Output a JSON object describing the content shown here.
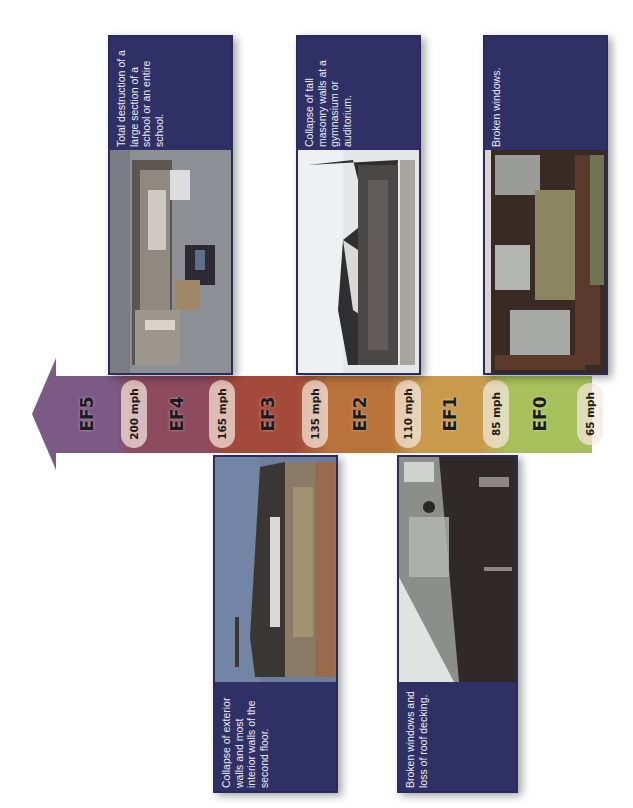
{
  "scale": {
    "title": "Enhanced Fujita Scale",
    "orientation": "rotated -90deg; arrow points left toward stronger ratings",
    "levels": [
      {
        "id": "EF5",
        "label": "EF5",
        "color": "#7b5a86"
      },
      {
        "id": "EF4",
        "label": "EF4",
        "color": "#8e4a5e"
      },
      {
        "id": "EF3",
        "label": "EF3",
        "color": "#a44a3b"
      },
      {
        "id": "EF2",
        "label": "EF2",
        "color": "#b9733a"
      },
      {
        "id": "EF1",
        "label": "EF1",
        "color": "#c99a4c"
      },
      {
        "id": "EF0",
        "label": "EF0",
        "color": "#a7c05a"
      }
    ],
    "thresholds": [
      {
        "label": "200 mph"
      },
      {
        "label": "165 mph"
      },
      {
        "label": "135 mph"
      },
      {
        "label": "110 mph"
      },
      {
        "label": "85 mph"
      },
      {
        "label": "65 mph"
      }
    ]
  },
  "cards": {
    "ef4": {
      "level": "EF4",
      "caption": "Total destruction of a large section of a school or an entire school.",
      "photo": "debris-field-photo"
    },
    "ef2": {
      "level": "EF2",
      "caption": "Collapse of tall masonry walls at a gymnasium or auditorium.",
      "photo": "collapsed-gymnasium-photo"
    },
    "ef0": {
      "level": "EF0",
      "caption": "Broken windows.",
      "photo": "brick-building-windows-photo"
    },
    "ef3": {
      "level": "EF3",
      "caption": "Collapse of exterior walls and most interior walls of the second floor.",
      "photo": "damaged-school-building-photo"
    },
    "ef1": {
      "level": "EF1",
      "caption": "Broken windows and loss of roof decking.",
      "photo": "damaged-roof-photo"
    }
  },
  "colors": {
    "card_background": "#2f3065",
    "card_text": "#ececf4",
    "pill_background": "#f5e8de"
  }
}
